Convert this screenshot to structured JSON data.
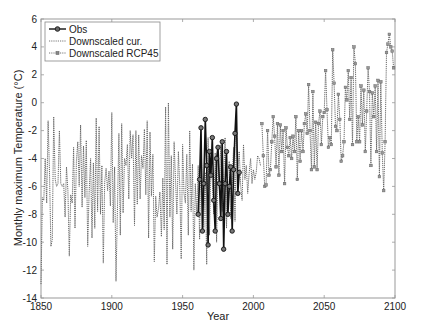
{
  "chart_data": {
    "type": "line",
    "title": "",
    "xlabel": "Year",
    "ylabel": "Monthly maximum Temperature (°C)",
    "xlim": [
      1850,
      2100
    ],
    "ylim": [
      -14,
      6
    ],
    "xticks": [
      1850,
      1900,
      1950,
      2000,
      2050,
      2100
    ],
    "yticks": [
      -14,
      -12,
      -10,
      -8,
      -6,
      -4,
      -2,
      0,
      2,
      4,
      6
    ],
    "grid": false,
    "legend_position": "upper left",
    "legend": [
      "Obs",
      "Downscaled cur.",
      "Downscaled RCP45"
    ],
    "series": [
      {
        "name": "Downscaled cur.",
        "style": "dotted",
        "x": [
          1850,
          1851,
          1852,
          1853,
          1854,
          1855,
          1856,
          1857,
          1858,
          1859,
          1860,
          1861,
          1862,
          1863,
          1864,
          1865,
          1866,
          1867,
          1868,
          1869,
          1870,
          1871,
          1872,
          1873,
          1874,
          1875,
          1876,
          1877,
          1878,
          1879,
          1880,
          1881,
          1882,
          1883,
          1884,
          1885,
          1886,
          1887,
          1888,
          1889,
          1890,
          1891,
          1892,
          1893,
          1894,
          1895,
          1896,
          1897,
          1898,
          1899,
          1900,
          1901,
          1902,
          1903,
          1904,
          1905,
          1906,
          1907,
          1908,
          1909,
          1910,
          1911,
          1912,
          1913,
          1914,
          1915,
          1916,
          1917,
          1918,
          1919,
          1920,
          1921,
          1922,
          1923,
          1924,
          1925,
          1926,
          1927,
          1928,
          1929,
          1930,
          1931,
          1932,
          1933,
          1934,
          1935,
          1936,
          1937,
          1938,
          1939,
          1940,
          1941,
          1942,
          1943,
          1944,
          1945,
          1946,
          1947,
          1948,
          1949,
          1950,
          1951,
          1952,
          1953,
          1954,
          1955,
          1956,
          1957,
          1958,
          1959,
          1960,
          1961,
          1962,
          1963,
          1964,
          1965,
          1966,
          1967,
          1968,
          1969,
          1970,
          1971,
          1972,
          1973,
          1974,
          1975,
          1976,
          1977,
          1978,
          1979,
          1980,
          1981,
          1982,
          1983,
          1984,
          1985,
          1986,
          1987,
          1988,
          1989,
          1990,
          1991,
          1992,
          1993,
          1994,
          1995,
          1996,
          1997,
          1998,
          1999,
          2000,
          2001,
          2002,
          2003,
          2004,
          2005
        ],
        "values": [
          -13.0,
          -6.8,
          -7.0,
          -4.0,
          -7.2,
          -1.3,
          -5.0,
          -10.3,
          -9.8,
          -1.0,
          -5.5,
          -6.0,
          -5.8,
          -2.0,
          -5.8,
          -6.0,
          -5.8,
          -8.2,
          -4.6,
          -6.3,
          -11.0,
          -6.6,
          -7.2,
          -3.2,
          -9.0,
          -4.2,
          -2.8,
          -6.0,
          -1.6,
          -7.5,
          -3.1,
          -6.8,
          -2.7,
          -10.3,
          -6.5,
          -4.0,
          -9.7,
          -4.3,
          -9.0,
          -1.1,
          -7.8,
          -1.7,
          -8.0,
          -4.5,
          -11.5,
          -5.7,
          -4.7,
          -6.3,
          -4.9,
          -7.4,
          -0.7,
          -8.6,
          -4.6,
          -12.8,
          -7.4,
          -2.2,
          -9.5,
          -1.5,
          -7.9,
          -4.0,
          -4.5,
          -3.0,
          -6.9,
          -2.0,
          -4.0,
          -2.3,
          -8.8,
          -2.0,
          -7.3,
          -2.3,
          -6.9,
          -3.8,
          -4.7,
          -1.9,
          -6.6,
          -1.3,
          -9.7,
          -2.1,
          -6.7,
          -3.7,
          -11.4,
          -6.7,
          -8.2,
          -7.6,
          -6.4,
          -9.6,
          -5.4,
          -9.1,
          -0.3,
          -11.6,
          0.0,
          -8.2,
          -3.8,
          -10.5,
          -2.8,
          -5.5,
          -8.0,
          -3.5,
          -6.0,
          -11.2,
          -3.0,
          -6.5,
          -7.2,
          -3.7,
          -9.5,
          -2.0,
          -7.8,
          -4.4,
          -12.0,
          -5.8,
          -8.0,
          -4.5,
          -9.8,
          -3.2,
          -6.0,
          -9.0,
          -5.0,
          -11.6,
          -2.5,
          -9.5,
          -4.0,
          -5.7,
          -8.0,
          -3.6,
          -10.0,
          -4.2,
          -6.2,
          -3.0,
          -7.8,
          -5.3,
          -2.5,
          -9.0,
          -5.0,
          -4.2,
          -8.3,
          -5.5,
          -3.2,
          -8.5,
          -2.0,
          -4.8,
          -3.5,
          -6.0,
          -7.0,
          -3.0,
          -5.5,
          -4.5,
          -6.5,
          -5.0,
          -4.0,
          -5.8,
          -4.8,
          -5.5,
          -5.0,
          -3.8,
          -4.0,
          -4.5
        ]
      },
      {
        "name": "Obs",
        "style": "solid-circle",
        "x": [
          1961,
          1962,
          1963,
          1964,
          1965,
          1966,
          1967,
          1968,
          1969,
          1970,
          1971,
          1972,
          1973,
          1974,
          1975,
          1976,
          1977,
          1978,
          1979,
          1980,
          1981,
          1982,
          1983,
          1984,
          1985,
          1986,
          1987,
          1988,
          1989,
          1990
        ],
        "values": [
          -8.0,
          -5.5,
          -1.8,
          -9.2,
          -5.8,
          -1.2,
          -4.5,
          -10.2,
          -3.5,
          -5.2,
          -2.5,
          -7.0,
          -9.2,
          -4.0,
          -3.2,
          -5.8,
          -8.3,
          -2.8,
          -10.5,
          -5.8,
          -3.5,
          -8.0,
          -6.0,
          -4.6,
          -9.2,
          -4.8,
          -2.2,
          -0.1,
          -6.5,
          -5.0
        ]
      },
      {
        "name": "Downscaled RCP45",
        "style": "dotted-square",
        "x": [
          2006,
          2007,
          2008,
          2009,
          2010,
          2011,
          2012,
          2013,
          2014,
          2015,
          2016,
          2017,
          2018,
          2019,
          2020,
          2021,
          2022,
          2023,
          2024,
          2025,
          2026,
          2027,
          2028,
          2029,
          2030,
          2031,
          2032,
          2033,
          2034,
          2035,
          2036,
          2037,
          2038,
          2039,
          2040,
          2041,
          2042,
          2043,
          2044,
          2045,
          2046,
          2047,
          2048,
          2049,
          2050,
          2051,
          2052,
          2053,
          2054,
          2055,
          2056,
          2057,
          2058,
          2059,
          2060,
          2061,
          2062,
          2063,
          2064,
          2065,
          2066,
          2067,
          2068,
          2069,
          2070,
          2071,
          2072,
          2073,
          2074,
          2075,
          2076,
          2077,
          2078,
          2079,
          2080,
          2081,
          2082,
          2083,
          2084,
          2085,
          2086,
          2087,
          2088,
          2089,
          2090,
          2091,
          2092,
          2093,
          2094,
          2095,
          2096,
          2097,
          2098,
          2099
        ],
        "values": [
          -1.5,
          -3.8,
          -6.0,
          -5.9,
          -2.0,
          -5.2,
          -4.8,
          -2.8,
          -1.0,
          -2.4,
          -4.6,
          -1.5,
          -5.2,
          -1.6,
          -3.5,
          -2.0,
          -5.8,
          -1.8,
          -3.2,
          -3.8,
          -2.5,
          -4.0,
          -2.4,
          -3.5,
          -1.0,
          -5.5,
          -2.0,
          -4.2,
          -2.0,
          -3.5,
          -1.5,
          -0.8,
          -2.2,
          1.3,
          -2.0,
          -4.8,
          0.8,
          -4.6,
          -1.4,
          -4.8,
          -1.5,
          -0.6,
          -3.0,
          -1.0,
          -0.7,
          2.3,
          -0.5,
          -3.2,
          -2.5,
          -3.0,
          3.8,
          1.4,
          -1.7,
          -2.0,
          0.6,
          -1.2,
          -4.2,
          -3.8,
          -2.8,
          1.1,
          0.2,
          2.3,
          -1.2,
          1.8,
          -3.0,
          4.0,
          2.8,
          -2.8,
          -1.0,
          -2.8,
          1.2,
          -1.6,
          0.9,
          -3.5,
          -0.6,
          2.5,
          0.8,
          -4.5,
          0.7,
          -1.0,
          1.2,
          -3.5,
          1.6,
          -5.3,
          1.5,
          -3.6,
          -6.3,
          -2.8,
          3.6,
          4.2,
          4.9,
          4.0,
          3.7,
          2.5
        ]
      }
    ]
  }
}
